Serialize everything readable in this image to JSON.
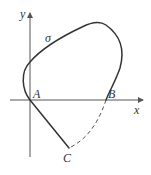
{
  "diagram": {
    "type": "closed-curve-on-axes",
    "axes": {
      "x_label": "x",
      "y_label": "y"
    },
    "curve": {
      "label": "σ",
      "solid_path": "C → A → top → right → B",
      "dashed_path": "B → C"
    },
    "points": [
      {
        "name": "A",
        "label": "A",
        "position": "intersection of curve with x-axis at origin"
      },
      {
        "name": "B",
        "label": "B",
        "position": "intersection of curve with positive x-axis"
      },
      {
        "name": "C",
        "label": "C",
        "position": "lowest point of curve, below x-axis"
      }
    ],
    "colors": {
      "stroke": "#333333",
      "axis": "#555555",
      "background": "#ffffff"
    }
  }
}
